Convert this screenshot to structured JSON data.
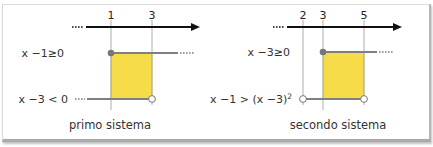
{
  "colors": {
    "axis": "#111111",
    "guide": "#9a9a9a",
    "segment": "#7f7f7f",
    "fill": "#f7dc4a",
    "fill_border": "#c9b030",
    "dot_filled": "#777777",
    "dot_open_fill": "#ffffff"
  },
  "panels": [
    {
      "caption": "primo sistema",
      "ticks": [
        "1",
        "3"
      ],
      "rows": [
        {
          "label": "x −1≥0",
          "interval": "[1, +∞)",
          "start": "closed"
        },
        {
          "label": "x −3 < 0",
          "interval": "(−∞, 3)",
          "end": "open"
        }
      ],
      "solution": "1 ≤ x < 3"
    },
    {
      "caption": "secondo sistema",
      "ticks": [
        "2",
        "3",
        "5"
      ],
      "rows": [
        {
          "label": "x −3≥0",
          "interval": "[3, +∞)",
          "start": "closed"
        },
        {
          "label": "x −1 > (x −3)",
          "label_sup": "2",
          "interval": "(2, 5)",
          "start": "open",
          "end": "open"
        }
      ],
      "solution": "3 ≤ x < 5"
    }
  ]
}
